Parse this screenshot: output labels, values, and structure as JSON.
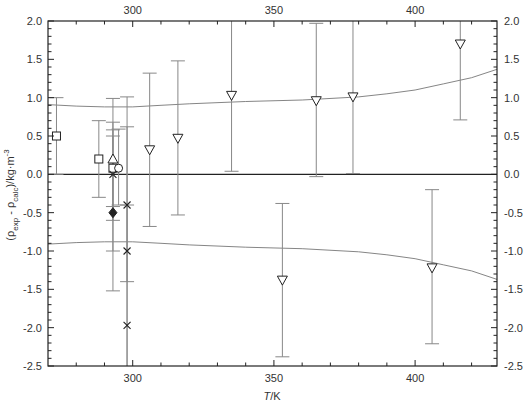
{
  "chart_data": {
    "type": "scatter",
    "title": "",
    "xlabel": "T/K",
    "ylabel": "(ρexp - ρcalc)/kg·m⁻³",
    "xlim": [
      270,
      429
    ],
    "ylim": [
      -2.5,
      2.0
    ],
    "x_ticks_major": [
      300,
      350,
      400
    ],
    "x_ticks_minor_step": 10,
    "y_ticks": [
      2.0,
      1.5,
      1.0,
      0.5,
      0.0,
      -0.5,
      -1.0,
      -1.5,
      -2.0,
      -2.5
    ],
    "y_tick_labels": [
      "2.0",
      "1.5",
      "1.0",
      "0.5",
      "0.0",
      "-0.5",
      "-1.0",
      "-1.5",
      "-2.0",
      "-2.5"
    ],
    "x_tick_labels": [
      "300",
      "350",
      "400"
    ],
    "grid": false,
    "mirror_axes": true,
    "zero_line": true,
    "series": [
      {
        "name": "square",
        "marker": "square-open",
        "points": [
          {
            "x": 273,
            "y": 0.5,
            "err_low": 0.0,
            "err_high": 1.0
          },
          {
            "x": 288,
            "y": 0.2,
            "err_low": -0.3,
            "err_high": 0.7
          },
          {
            "x": 293,
            "y": 0.08,
            "err_low": -0.42,
            "err_high": 0.58
          }
        ]
      },
      {
        "name": "triangle-up",
        "marker": "triangle-up-open",
        "points": [
          {
            "x": 293,
            "y": 0.2,
            "err_low": -1.0,
            "err_high": 0.99
          }
        ]
      },
      {
        "name": "circle",
        "marker": "circle-open",
        "points": [
          {
            "x": 295,
            "y": 0.08,
            "err_low": -0.4,
            "err_high": 0.59
          }
        ]
      },
      {
        "name": "diamond",
        "marker": "diamond-filled",
        "points": [
          {
            "x": 293,
            "y": -0.5,
            "err_low": -1.52,
            "err_high": 0.5
          }
        ]
      },
      {
        "name": "cross",
        "marker": "x",
        "points": [
          {
            "x": 293,
            "y": 0.0,
            "err_low": -0.6,
            "err_high": 0.68
          },
          {
            "x": 298,
            "y": -0.4,
            "err_low": -2.5,
            "err_high": 1.01
          },
          {
            "x": 298,
            "y": -1.0,
            "err_low": -1.4,
            "err_high": 0.62
          },
          {
            "x": 298,
            "y": -1.97,
            "err_low": -2.5,
            "err_high": -0.4
          }
        ]
      },
      {
        "name": "triangle-down",
        "marker": "triangle-down-open",
        "points": [
          {
            "x": 306,
            "y": 0.32,
            "err_low": -0.68,
            "err_high": 1.32
          },
          {
            "x": 316,
            "y": 0.47,
            "err_low": -0.53,
            "err_high": 1.48
          },
          {
            "x": 335,
            "y": 1.03,
            "err_low": 0.04,
            "err_high": 2.0
          },
          {
            "x": 353,
            "y": -1.38,
            "err_low": -2.38,
            "err_high": -0.38
          },
          {
            "x": 365,
            "y": 0.96,
            "err_low": -0.03,
            "err_high": 1.97
          },
          {
            "x": 378,
            "y": 1.01,
            "err_low": 0.01,
            "err_high": 2.0
          },
          {
            "x": 406,
            "y": -1.22,
            "err_low": -2.21,
            "err_high": -0.2
          },
          {
            "x": 416,
            "y": 1.7,
            "err_low": 0.71,
            "err_high": 2.0
          }
        ]
      }
    ],
    "bands": {
      "upper": [
        [
          270,
          0.91
        ],
        [
          280,
          0.89
        ],
        [
          290,
          0.88
        ],
        [
          300,
          0.88
        ],
        [
          310,
          0.9
        ],
        [
          320,
          0.92
        ],
        [
          340,
          0.95
        ],
        [
          360,
          0.97
        ],
        [
          380,
          1.01
        ],
        [
          390,
          1.05
        ],
        [
          400,
          1.1
        ],
        [
          410,
          1.18
        ],
        [
          420,
          1.26
        ],
        [
          429,
          1.37
        ]
      ],
      "lower": [
        [
          270,
          -0.91
        ],
        [
          280,
          -0.89
        ],
        [
          290,
          -0.88
        ],
        [
          300,
          -0.88
        ],
        [
          310,
          -0.9
        ],
        [
          320,
          -0.92
        ],
        [
          340,
          -0.95
        ],
        [
          360,
          -0.97
        ],
        [
          380,
          -1.01
        ],
        [
          390,
          -1.05
        ],
        [
          400,
          -1.1
        ],
        [
          410,
          -1.18
        ],
        [
          420,
          -1.26
        ],
        [
          429,
          -1.37
        ]
      ]
    },
    "colors": {
      "axis": "#222222",
      "errorbar": "#888888",
      "band": "#777777",
      "marker": "#222222"
    }
  },
  "labels": {
    "xlabel_T": "T",
    "xlabel_unit": "/K",
    "ylabel_open": "(ρ",
    "ylabel_exp": "exp",
    "ylabel_mid": " - ρ",
    "ylabel_calc": "calc",
    "ylabel_unit": ")/kg·m",
    "ylabel_sup": "-3"
  }
}
